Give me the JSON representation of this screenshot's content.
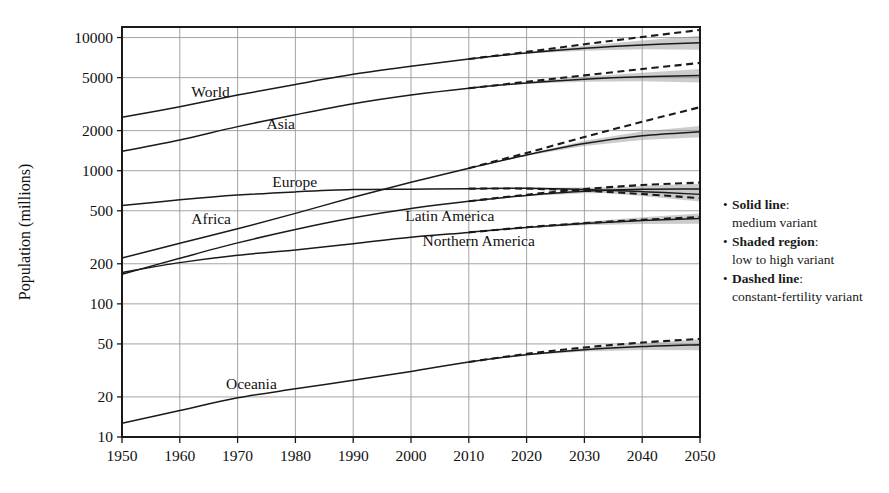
{
  "figure": {
    "y_axis_title": "Population (millions)",
    "background": "#ffffff",
    "ink_color": "#1a1a1a",
    "grid_color": "#9a9a9a",
    "band_color": "#c9c9c9"
  },
  "legend": {
    "items": [
      {
        "bullet": "•",
        "term": "Solid line",
        "colon": ":",
        "desc": "medium variant"
      },
      {
        "bullet": "•",
        "term": "Shaded region",
        "colon": ":",
        "desc": "low to high variant"
      },
      {
        "bullet": "•",
        "term": "Dashed line",
        "colon": ":",
        "desc": "constant-fertility variant"
      }
    ]
  },
  "chart_data": {
    "type": "line",
    "title": "",
    "xlabel": "",
    "ylabel": "Population (millions)",
    "yscale": "log",
    "ylim": [
      10,
      12000
    ],
    "xlim": [
      1950,
      2050
    ],
    "grid": true,
    "legend_position": "right",
    "xticks": [
      1950,
      1960,
      1970,
      1980,
      1990,
      2000,
      2010,
      2020,
      2030,
      2040,
      2050
    ],
    "yticks": [
      10,
      20,
      50,
      100,
      200,
      500,
      1000,
      2000,
      5000,
      10000
    ],
    "ytick_labels": [
      "10",
      "20",
      "50",
      "100",
      "200",
      "500",
      "1000",
      "2000",
      "5000",
      "10000"
    ],
    "xtick_labels": [
      "1950",
      "1960",
      "1970",
      "1980",
      "1990",
      "2000",
      "2010",
      "2020",
      "2030",
      "2040",
      "2050"
    ],
    "x": [
      1950,
      1960,
      1970,
      1980,
      1990,
      2000,
      2010,
      2020,
      2030,
      2040,
      2050
    ],
    "projection_start": 2010,
    "series": [
      {
        "name": "World",
        "label": "World",
        "label_x": 1962,
        "label_y": 3600,
        "values": [
          2519,
          3022,
          3696,
          4442,
          5290,
          6086,
          6896,
          7667,
          8309,
          8801,
          9150
        ],
        "low": [
          2519,
          3022,
          3696,
          4442,
          5290,
          6086,
          6896,
          7580,
          7950,
          8150,
          8100
        ],
        "high": [
          2519,
          3022,
          3696,
          4442,
          5290,
          6086,
          6896,
          7750,
          8680,
          9500,
          10300
        ],
        "constant_fertility": [
          2519,
          3022,
          3696,
          4442,
          5290,
          6086,
          6896,
          7800,
          8900,
          10100,
          11400
        ]
      },
      {
        "name": "Asia",
        "label": "Asia",
        "label_x": 1975,
        "label_y": 2050,
        "values": [
          1398,
          1702,
          2143,
          2632,
          3181,
          3698,
          4164,
          4565,
          4870,
          5070,
          5180
        ],
        "low": [
          1398,
          1702,
          2143,
          2632,
          3181,
          3698,
          4164,
          4500,
          4650,
          4700,
          4600
        ],
        "high": [
          1398,
          1702,
          2143,
          2632,
          3181,
          3698,
          4164,
          4640,
          5090,
          5450,
          5800
        ],
        "constant_fertility": [
          1398,
          1702,
          2143,
          2632,
          3181,
          3698,
          4164,
          4650,
          5200,
          5800,
          6450
        ]
      },
      {
        "name": "Africa",
        "label": "Africa",
        "label_x": 1962,
        "label_y": 400,
        "values": [
          221,
          285,
          366,
          478,
          632,
          820,
          1044,
          1312,
          1600,
          1830,
          1960
        ],
        "low": [
          221,
          285,
          366,
          478,
          632,
          820,
          1044,
          1295,
          1530,
          1700,
          1780
        ],
        "high": [
          221,
          285,
          366,
          478,
          632,
          820,
          1044,
          1330,
          1675,
          1970,
          2170
        ],
        "constant_fertility": [
          221,
          285,
          366,
          478,
          632,
          820,
          1044,
          1360,
          1790,
          2330,
          3000
        ]
      },
      {
        "name": "Europe",
        "label": "Europe",
        "label_x": 1976,
        "label_y": 760,
        "values": [
          547,
          604,
          656,
          693,
          721,
          727,
          733,
          737,
          723,
          696,
          664
        ],
        "low": [
          547,
          604,
          656,
          693,
          721,
          727,
          733,
          730,
          698,
          645,
          588
        ],
        "high": [
          547,
          604,
          656,
          693,
          721,
          727,
          733,
          744,
          748,
          748,
          745
        ],
        "constant_fertility": [
          547,
          604,
          656,
          693,
          721,
          727,
          733,
          733,
          707,
          668,
          622
        ]
      },
      {
        "name": "Latin America",
        "label": "Latin America",
        "label_x": 1999,
        "label_y": 420,
        "values": [
          167,
          220,
          287,
          362,
          443,
          521,
          590,
          652,
          700,
          726,
          729
        ],
        "low": [
          167,
          220,
          287,
          362,
          443,
          521,
          590,
          645,
          678,
          684,
          665
        ],
        "high": [
          167,
          220,
          287,
          362,
          443,
          521,
          590,
          659,
          722,
          770,
          798
        ],
        "constant_fertility": [
          167,
          220,
          287,
          362,
          443,
          521,
          590,
          660,
          727,
          780,
          814
        ]
      },
      {
        "name": "Northern America",
        "label": "Northern America",
        "label_x": 2002,
        "label_y": 270,
        "values": [
          172,
          204,
          232,
          254,
          283,
          316,
          344,
          375,
          401,
          422,
          438
        ],
        "low": [
          172,
          204,
          232,
          254,
          283,
          316,
          344,
          371,
          389,
          398,
          400
        ],
        "high": [
          172,
          204,
          232,
          254,
          283,
          316,
          344,
          380,
          414,
          447,
          478
        ],
        "constant_fertility": [
          172,
          204,
          232,
          254,
          283,
          316,
          344,
          376,
          404,
          428,
          448
        ]
      },
      {
        "name": "Oceania",
        "label": "Oceania",
        "label_x": 1968,
        "label_y": 23,
        "values": [
          12.7,
          15.8,
          19.7,
          23.0,
          26.7,
          31.1,
          36.6,
          41.5,
          45.2,
          47.8,
          49.4
        ],
        "low": [
          12.7,
          15.8,
          19.7,
          23.0,
          26.7,
          31.1,
          36.6,
          41.1,
          43.9,
          45.0,
          44.9
        ],
        "high": [
          12.7,
          15.8,
          19.7,
          23.0,
          26.7,
          31.1,
          36.6,
          42.0,
          46.6,
          50.6,
          54.2
        ],
        "constant_fertility": [
          12.7,
          15.8,
          19.7,
          23.0,
          26.7,
          31.1,
          36.6,
          42.1,
          47.0,
          51.2,
          54.6
        ]
      }
    ]
  }
}
